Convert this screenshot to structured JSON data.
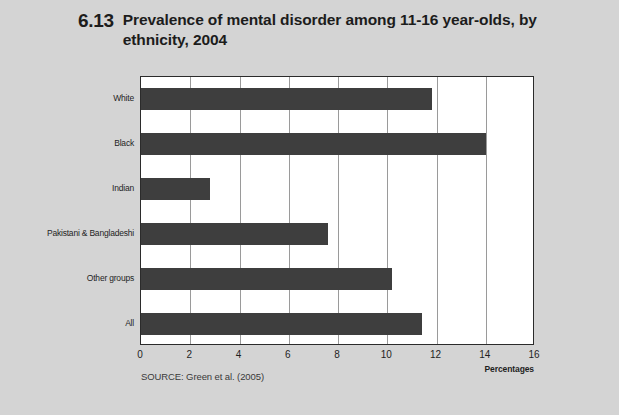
{
  "figure": {
    "number": "6.13",
    "title": "Prevalence of mental disorder among 11-16 year-olds, by ethnicity, 2004",
    "source": "SOURCE: Green et al. (2005)",
    "axis_label": "Percentages"
  },
  "colors": {
    "page_background": "#d4d4d4",
    "plot_background": "#ffffff",
    "bar": "#3e3e3e",
    "frame": "#2b2b2b",
    "gridline": "#9a9a9a",
    "text": "#1c1c1c"
  },
  "chart_data": {
    "type": "bar",
    "orientation": "horizontal",
    "title": "6.13 Prevalence of mental disorder among 11-16 year-olds, by ethnicity, 2004",
    "xlabel": "Percentages",
    "ylabel": "",
    "categories": [
      "White",
      "Black",
      "Indian",
      "Pakistani & Bangladeshi",
      "Other groups",
      "All"
    ],
    "values": [
      11.8,
      14.0,
      2.8,
      7.6,
      10.2,
      11.4
    ],
    "xlim": [
      0,
      16
    ],
    "xticks": [
      0,
      2,
      4,
      6,
      8,
      10,
      12,
      14,
      16
    ],
    "xtick_labels": [
      "0",
      "2",
      "4",
      "6",
      "8",
      "10",
      "12",
      "14",
      "16"
    ],
    "grid": "vertical",
    "legend": "none",
    "series": [
      {
        "name": "Prevalence of mental disorder",
        "values": [
          11.8,
          14.0,
          2.8,
          7.6,
          10.2,
          11.4
        ]
      }
    ]
  }
}
